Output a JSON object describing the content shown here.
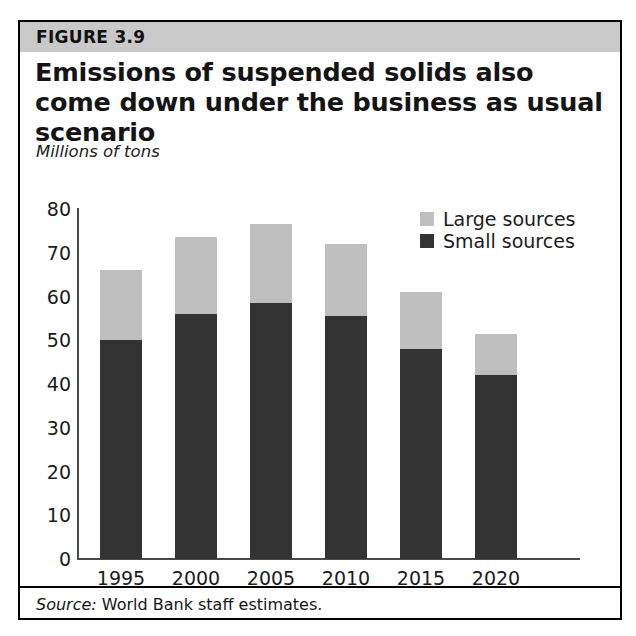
{
  "figure": {
    "number_label": "FIGURE 3.9",
    "title": "Emissions of suspended solids also come down under the business as usual scenario",
    "units": "Millions of tons",
    "source_label": "Source:",
    "source_text": "World Bank staff estimates.",
    "band_color": "#c9c9c9",
    "border_color": "#000000"
  },
  "chart_data": {
    "type": "bar",
    "stacked": true,
    "title": "Emissions of suspended solids also come down under the business as usual scenario",
    "subtitle": "Millions of tons",
    "xlabel": "",
    "ylabel": "Millions of tons",
    "ylim": [
      0,
      80
    ],
    "ytick_step": 10,
    "yticks": [
      80,
      70,
      60,
      50,
      40,
      30,
      20,
      10,
      0
    ],
    "categories": [
      "1995",
      "2000",
      "2005",
      "2010",
      "2015",
      "2020"
    ],
    "grid": false,
    "legend_position": "top-right",
    "series": [
      {
        "name": "Large sources",
        "color": "#bfbfbf",
        "values": [
          16,
          17.5,
          18,
          16.5,
          13,
          9.5
        ]
      },
      {
        "name": "Small sources",
        "color": "#333333",
        "values": [
          50,
          56,
          58.5,
          55.5,
          48,
          42
        ]
      }
    ],
    "totals": [
      66,
      73.5,
      76.5,
      72,
      61,
      51.5
    ]
  },
  "axis": {
    "y_tick_labels": [
      "80",
      "70",
      "60",
      "50",
      "40",
      "30",
      "20",
      "10",
      "0"
    ],
    "x_tick_labels": [
      "1995",
      "2000",
      "2005",
      "2010",
      "2015",
      "2020"
    ]
  },
  "legend": {
    "items": [
      {
        "label": "Large sources",
        "color": "#bfbfbf"
      },
      {
        "label": "Small sources",
        "color": "#333333"
      }
    ]
  }
}
